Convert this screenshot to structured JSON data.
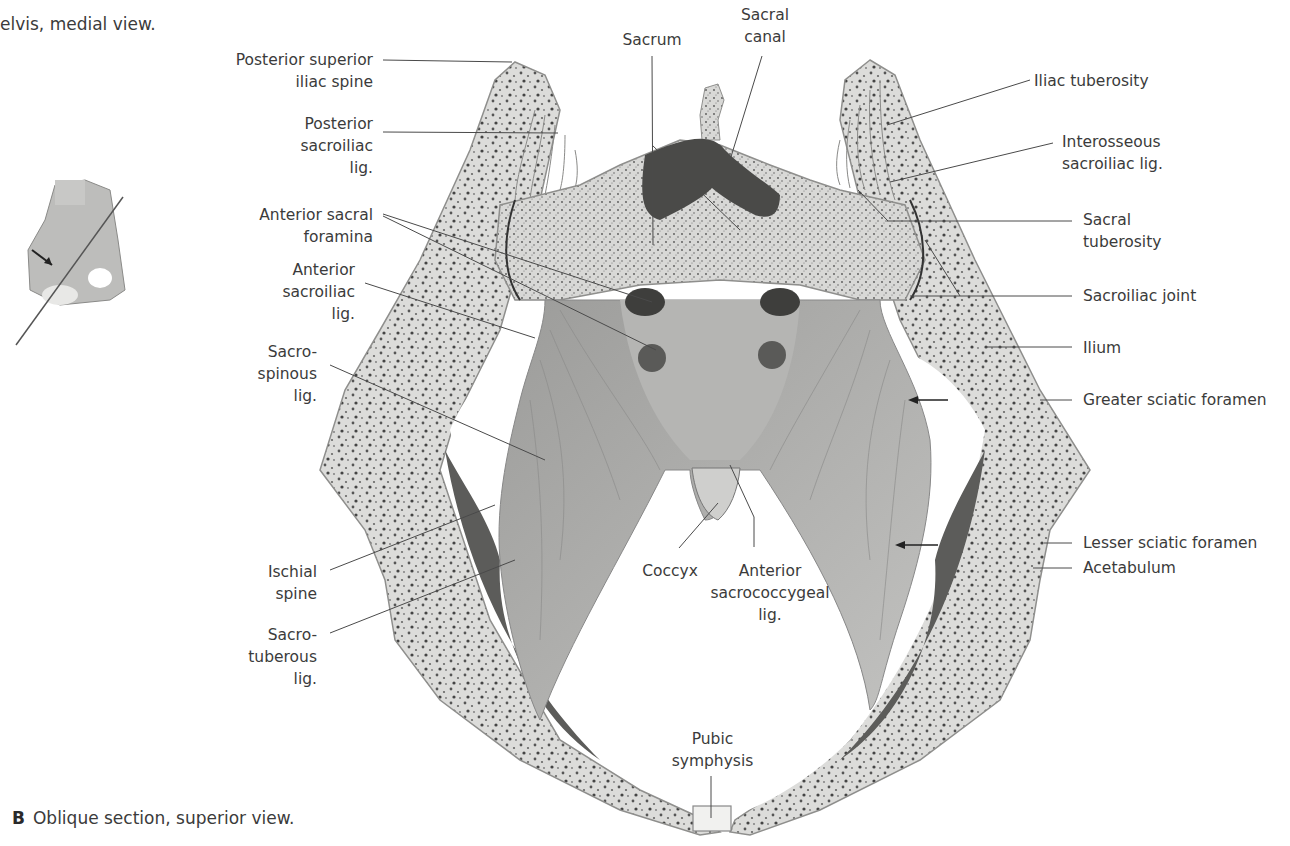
{
  "header": {
    "caption_fragment": "elvis, medial view."
  },
  "figure": {
    "letter": "B",
    "caption": "Oblique section, superior view.",
    "inset": {
      "description": "pelvis-medial-view-thumbnail-with-section-line"
    }
  },
  "labels": {
    "posterior_superior_iliac_spine": "Posterior superior\niliac spine",
    "posterior_sacroiliac_lig": "Posterior\nsacroiliac\nlig.",
    "anterior_sacral_foramina": "Anterior sacral\nforamina",
    "anterior_sacroiliac_lig": "Anterior\nsacroiliac\nlig.",
    "sacrospinous_lig": "Sacro-\nspinous\nlig.",
    "ischial_spine": "Ischial\nspine",
    "sacrotuberous_lig": "Sacro-\ntuberous\nlig.",
    "sacrum": "Sacrum",
    "sacral_canal": "Sacral\ncanal",
    "iliac_tuberosity": "Iliac tuberosity",
    "interosseous_sacroiliac_lig": "Interosseous\nsacroiliac lig.",
    "sacral_tuberosity": "Sacral\ntuberosity",
    "sacroiliac_joint": "Sacroiliac joint",
    "ilium": "Ilium",
    "greater_sciatic_foramen": "Greater sciatic foramen",
    "lesser_sciatic_foramen": "Lesser sciatic foramen",
    "acetabulum": "Acetabulum",
    "coccyx": "Coccyx",
    "anterior_sacrococcygeal_lig": "Anterior\nsacrococcygeal\nlig.",
    "pubic_symphysis": "Pubic\nsymphysis"
  },
  "colors": {
    "bone_fill": "#e6e6e4",
    "bone_edge": "#9a9a98",
    "bone_speckle": "#4a4a4a",
    "ligament": "#a9a9a7",
    "ligament_dark": "#6e6e6c",
    "canal": "#4a4a4a",
    "leader": "#4a4a4a",
    "text": "#3b3b3b"
  }
}
